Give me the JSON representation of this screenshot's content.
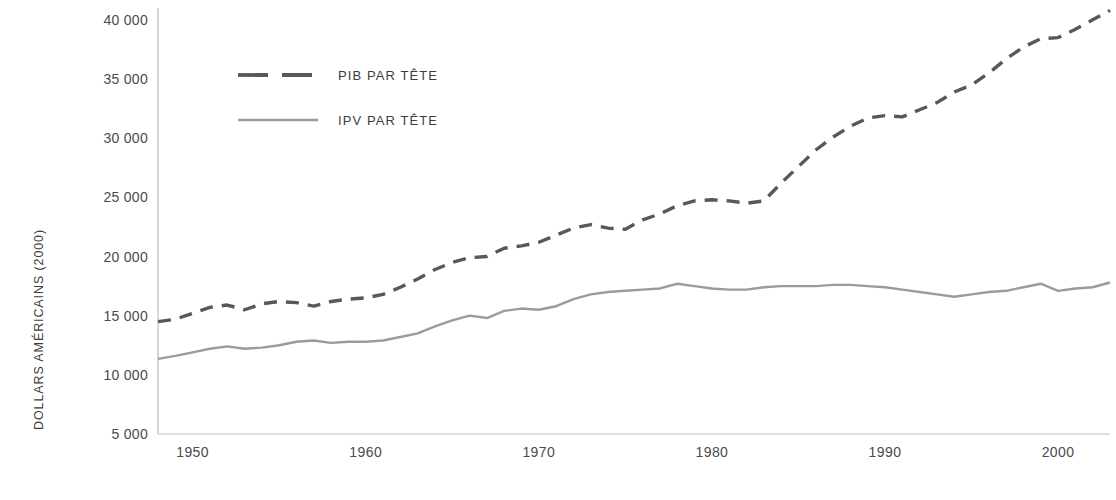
{
  "chart_data": {
    "type": "line",
    "title": "",
    "xlabel": "",
    "ylabel": "DOLLARS AMÉRICAINS (2000)",
    "xlim": [
      1948,
      2003
    ],
    "ylim": [
      5000,
      41000
    ],
    "grid": false,
    "legend_position": "top-left-inside",
    "x_ticks": [
      "1950",
      "1960",
      "1970",
      "1980",
      "1990",
      "2000"
    ],
    "x_tick_values": [
      1950,
      1960,
      1970,
      1980,
      1990,
      2000
    ],
    "y_ticks": [
      "5 000",
      "10 000",
      "15 000",
      "20 000",
      "25 000",
      "30 000",
      "35 000",
      "40 000"
    ],
    "y_tick_values": [
      5000,
      10000,
      15000,
      20000,
      25000,
      30000,
      35000,
      40000
    ],
    "x": [
      1948,
      1949,
      1950,
      1951,
      1952,
      1953,
      1954,
      1955,
      1956,
      1957,
      1958,
      1959,
      1960,
      1961,
      1962,
      1963,
      1964,
      1965,
      1966,
      1967,
      1968,
      1969,
      1970,
      1971,
      1972,
      1973,
      1974,
      1975,
      1976,
      1977,
      1978,
      1979,
      1980,
      1981,
      1982,
      1983,
      1984,
      1985,
      1986,
      1987,
      1988,
      1989,
      1990,
      1991,
      1992,
      1993,
      1994,
      1995,
      1996,
      1997,
      1998,
      1999,
      2000,
      2001,
      2002,
      2003
    ],
    "series": [
      {
        "name": "PIB PAR TÊTE",
        "style": "dashed",
        "color": "#585858",
        "values": [
          14500,
          14700,
          15200,
          15700,
          15900,
          15500,
          16000,
          16200,
          16100,
          15800,
          16200,
          16400,
          16500,
          16800,
          17400,
          18100,
          18900,
          19500,
          19900,
          20000,
          20700,
          20900,
          21200,
          21800,
          22400,
          22700,
          22400,
          22300,
          23100,
          23600,
          24300,
          24700,
          24800,
          24700,
          24500,
          24700,
          26200,
          27600,
          29000,
          30100,
          31000,
          31700,
          31900,
          31800,
          32400,
          33000,
          33900,
          34500,
          35500,
          36700,
          37700,
          38400,
          38500,
          39200,
          40000,
          40800
        ]
      },
      {
        "name": "IPV PAR TÊTE",
        "style": "solid",
        "color": "#9b9b9b",
        "values": [
          11350,
          11600,
          11900,
          12200,
          12400,
          12200,
          12300,
          12500,
          12800,
          12900,
          12700,
          12800,
          12800,
          12900,
          13200,
          13500,
          14100,
          14600,
          15000,
          14800,
          15400,
          15600,
          15500,
          15800,
          16400,
          16800,
          17000,
          17100,
          17200,
          17300,
          17700,
          17500,
          17300,
          17200,
          17200,
          17400,
          17500,
          17500,
          17500,
          17600,
          17600,
          17500,
          17400,
          17200,
          17000,
          16800,
          16600,
          16800,
          17000,
          17100,
          17400,
          17700,
          17100,
          17300,
          17400,
          17800
        ]
      }
    ]
  },
  "axis": {
    "y_title": "DOLLARS AMÉRICAINS (2000)"
  },
  "legend": {
    "entries": [
      {
        "label": "PIB PAR TÊTE"
      },
      {
        "label": "IPV PAR TÊTE"
      }
    ]
  }
}
